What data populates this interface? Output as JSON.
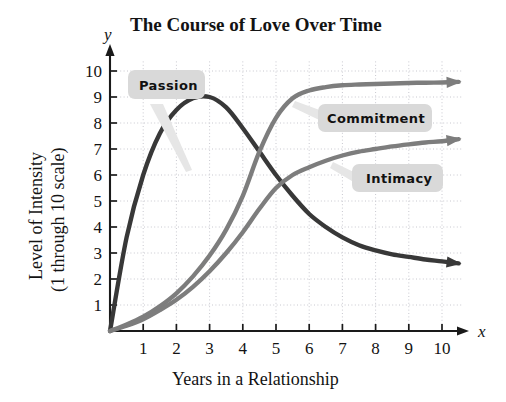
{
  "chart_data": {
    "type": "line",
    "title": "The Course of Love Over Time",
    "xlabel": "Years in a Relationship",
    "ylabel_line1": "Level of Intensity",
    "ylabel_line2": "(1 through 10 scale)",
    "x_axis_letter": "x",
    "y_axis_letter": "y",
    "xlim": [
      0,
      10.6
    ],
    "ylim": [
      0,
      10.4
    ],
    "grid": true,
    "grid_style": "dotted",
    "legend": "inline-callout-labels",
    "x_ticks": [
      "1",
      "2",
      "3",
      "4",
      "5",
      "6",
      "7",
      "8",
      "9",
      "10"
    ],
    "y_ticks": [
      "1",
      "2",
      "3",
      "4",
      "5",
      "6",
      "7",
      "8",
      "9",
      "10"
    ],
    "x": [
      0,
      0.5,
      1,
      1.5,
      2,
      2.5,
      3,
      3.5,
      4,
      4.5,
      5,
      5.5,
      6,
      6.5,
      7,
      7.5,
      8,
      8.5,
      9,
      9.5,
      10,
      10.5
    ],
    "series": [
      {
        "name": "Passion",
        "color": "#383838",
        "values": [
          0,
          3.6,
          6.0,
          7.6,
          8.5,
          8.95,
          9.0,
          8.6,
          7.8,
          6.9,
          6.0,
          5.2,
          4.5,
          4.0,
          3.6,
          3.3,
          3.1,
          2.95,
          2.85,
          2.75,
          2.68,
          2.6
        ],
        "peak": {
          "x": 3,
          "y": 9
        },
        "end_arrow": true
      },
      {
        "name": "Commitment",
        "color": "#7d7d7d",
        "values": [
          0,
          0.25,
          0.55,
          0.95,
          1.45,
          2.1,
          2.9,
          3.9,
          5.2,
          6.9,
          8.2,
          8.95,
          9.25,
          9.38,
          9.45,
          9.48,
          9.5,
          9.52,
          9.54,
          9.55,
          9.56,
          9.58
        ],
        "end_arrow": true
      },
      {
        "name": "Intimacy",
        "color": "#7d7d7d",
        "values": [
          0,
          0.2,
          0.45,
          0.8,
          1.2,
          1.7,
          2.3,
          3.0,
          3.8,
          4.7,
          5.5,
          6.0,
          6.3,
          6.55,
          6.75,
          6.9,
          7.0,
          7.1,
          7.18,
          7.25,
          7.3,
          7.38
        ],
        "end_arrow": true
      }
    ]
  },
  "callouts": [
    {
      "label": "Passion",
      "box_color": "#d9d9d9"
    },
    {
      "label": "Commitment",
      "box_color": "#d9d9d9"
    },
    {
      "label": "Intimacy",
      "box_color": "#d9d9d9"
    }
  ],
  "colors": {
    "axis": "#1a1a1a",
    "grid": "#c8c8cf",
    "passion": "#383838",
    "commitment": "#7d7d7d",
    "intimacy": "#7d7d7d",
    "callout_box": "#d9d9d9",
    "callout_tail": "#e4e4e4",
    "background": "#ffffff"
  }
}
